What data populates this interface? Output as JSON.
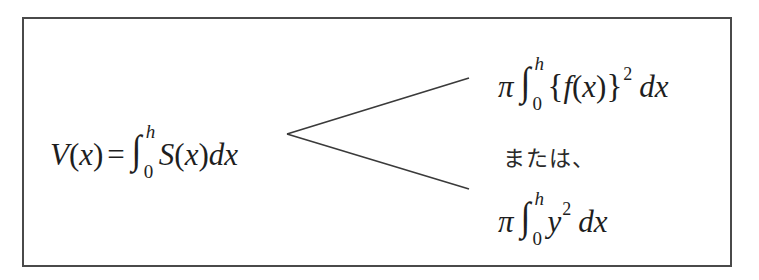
{
  "frame": {
    "border_color": "#4a4a4a",
    "background": "#ffffff"
  },
  "formula_main": {
    "lhs_func": "V",
    "lhs_open": "(",
    "lhs_var": "x",
    "lhs_close": ")",
    "equals": "=",
    "integral_sign": "∫",
    "lower_limit": "0",
    "upper_limit": "h",
    "integrand_func": "S",
    "integrand_open": "(",
    "integrand_var": "x",
    "integrand_close": ")",
    "differential": "dx"
  },
  "branch": {
    "vertex": [
      287,
      134
    ],
    "upper_end": [
      469,
      78
    ],
    "lower_end": [
      469,
      189
    ],
    "color": "#3a3a3a"
  },
  "formula_upper": {
    "pi": "π",
    "integral_sign": "∫",
    "lower_limit": "0",
    "upper_limit": "h",
    "brace_open": "{",
    "func": "f",
    "paren_open": "(",
    "var": "x",
    "paren_close": ")",
    "brace_close": "}",
    "exponent": "2",
    "differential": "dx"
  },
  "connector_text": "または、",
  "formula_lower": {
    "pi": "π",
    "integral_sign": "∫",
    "lower_limit": "0",
    "upper_limit": "h",
    "base": "y",
    "exponent": "2",
    "differential": "dx"
  }
}
